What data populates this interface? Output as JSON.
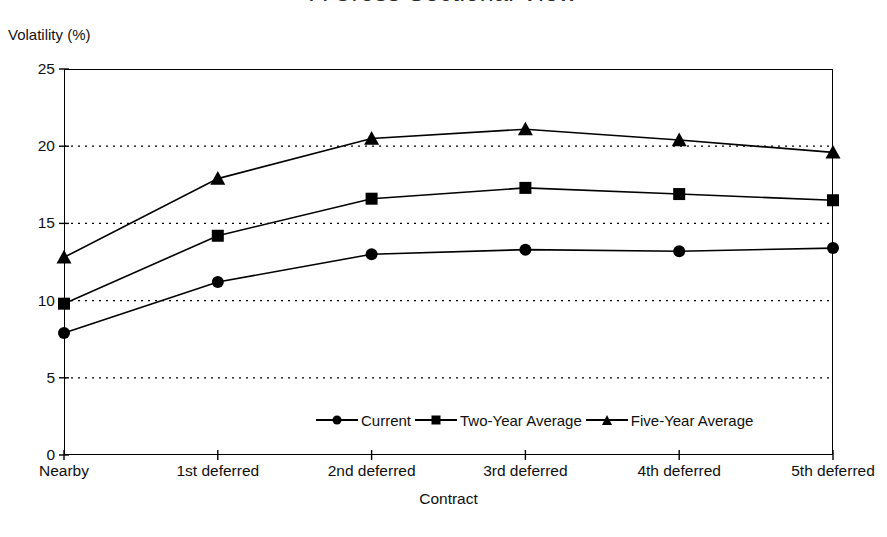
{
  "title": "A Cross Sectional View",
  "axis": {
    "y_title": "Volatility (%)",
    "x_title": "Contract"
  },
  "legend": {
    "items": [
      {
        "label": "Current",
        "marker": "circle-marker-icon"
      },
      {
        "label": "Two-Year Average",
        "marker": "square-marker-icon"
      },
      {
        "label": "Five-Year Average",
        "marker": "triangle-marker-icon"
      }
    ]
  },
  "chart_data": {
    "type": "line",
    "title": "A Cross Sectional View",
    "xlabel": "Contract",
    "ylabel": "Volatility (%)",
    "categories": [
      "Nearby",
      "1st deferred",
      "2nd deferred",
      "3rd deferred",
      "4th deferred",
      "5th deferred"
    ],
    "ylim": [
      0,
      25
    ],
    "yticks": [
      0,
      5,
      10,
      15,
      20,
      25
    ],
    "ytick_labels": [
      "0",
      "5",
      "10",
      "15",
      "20",
      "25"
    ],
    "grid": "horizontal-dotted",
    "legend_position": "inside-bottom-center",
    "series": [
      {
        "name": "Current",
        "marker": "circle",
        "values": [
          7.9,
          11.2,
          13.0,
          13.3,
          13.2,
          13.4
        ]
      },
      {
        "name": "Two-Year Average",
        "marker": "square",
        "values": [
          9.8,
          14.2,
          16.6,
          17.3,
          16.9,
          16.5
        ]
      },
      {
        "name": "Five-Year Average",
        "marker": "triangle",
        "values": [
          12.8,
          17.9,
          20.5,
          21.1,
          20.4,
          19.6
        ]
      }
    ]
  }
}
